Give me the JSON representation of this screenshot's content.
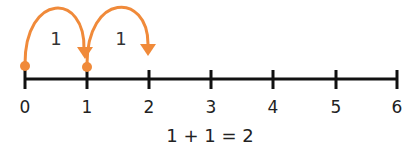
{
  "number_line": {
    "ticks": [
      "0",
      "1",
      "2",
      "3",
      "4",
      "5",
      "6"
    ],
    "tick_x": [
      25,
      87,
      149,
      211,
      273,
      336,
      397
    ],
    "line_color": "#111111"
  },
  "jumps": [
    {
      "from": "0",
      "to": "1",
      "label": "1"
    },
    {
      "from": "1",
      "to": "2",
      "label": "1"
    }
  ],
  "accent_color": "#f08a3a",
  "equation": "1 + 1 = 2"
}
